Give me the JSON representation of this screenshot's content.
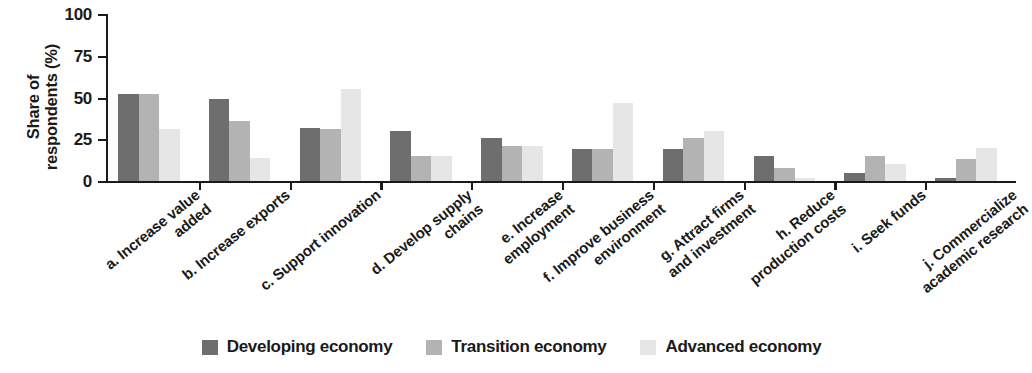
{
  "chart_data": {
    "type": "bar",
    "title": "",
    "subtitle": "",
    "xlabel": "",
    "ylabel": "Share of\nrespondents (%)",
    "ylim": [
      0,
      100
    ],
    "yticks": [
      0,
      25,
      50,
      75,
      100
    ],
    "ytick_labels": [
      "0",
      "25",
      "50",
      "75",
      "100"
    ],
    "grid": false,
    "legend_position": "bottom",
    "categories": [
      "a. Increase value\nadded",
      "b. Increase exports",
      "c. Support innovation",
      "d. Develop supply\nchains",
      "e. Increase\nemployment",
      "f. Improve business\nenvironment",
      "g. Attract firms\nand investment",
      "h. Reduce\nproduction costs",
      "i. Seek funds",
      "j. Commercialize\nacademic research"
    ],
    "series": [
      {
        "name": "Developing economy",
        "color": "#6e6e6e",
        "values": [
          52,
          49,
          32,
          30,
          26,
          19,
          19,
          15,
          5,
          2
        ]
      },
      {
        "name": "Transition economy",
        "color": "#b3b3b3",
        "values": [
          52,
          36,
          31,
          15,
          21,
          19,
          26,
          8,
          15,
          13
        ]
      },
      {
        "name": "Advanced economy",
        "color": "#e6e6e6",
        "values": [
          31,
          14,
          55,
          15,
          21,
          47,
          30,
          2,
          10,
          20
        ]
      }
    ]
  },
  "legend": {
    "items": [
      {
        "label": "Developing economy"
      },
      {
        "label": "Transition economy"
      },
      {
        "label": "Advanced economy"
      }
    ]
  }
}
